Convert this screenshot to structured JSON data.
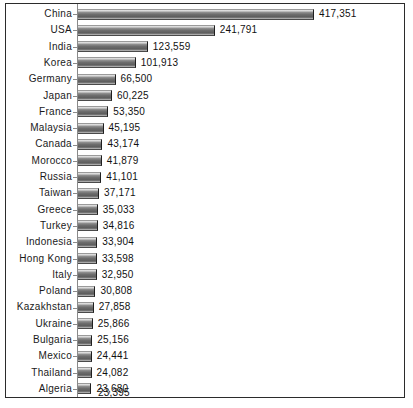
{
  "chart_data": {
    "type": "bar",
    "orientation": "horizontal",
    "title": "",
    "subtitle": "",
    "xlabel": "",
    "ylabel": "",
    "grid": false,
    "legend": null,
    "axis_line": true,
    "value_labels": true,
    "xlim": [
      0,
      417351
    ],
    "categories": [
      "China",
      "USA",
      "India",
      "Korea",
      "Germany",
      "Japan",
      "France",
      "Malaysia",
      "Canada",
      "Morocco",
      "Russia",
      "Taiwan",
      "Greece",
      "Turkey",
      "Indonesia",
      "Hong Kong",
      "Italy",
      "Poland",
      "Kazakhstan",
      "Ukraine",
      "Bulgaria",
      "Mexico",
      "Thailand",
      "Algeria",
      "Spain"
    ],
    "values": [
      417351,
      241791,
      123559,
      101913,
      66500,
      60225,
      53350,
      45195,
      43174,
      41879,
      41101,
      37171,
      35033,
      34816,
      33904,
      33598,
      32950,
      30808,
      27858,
      25866,
      25156,
      24441,
      24082,
      23680,
      23395
    ],
    "value_labels_text": [
      "417,351",
      "241,791",
      "123,559",
      "101,913",
      "66,500",
      "60,225",
      "53,350",
      "45,195",
      "43,174",
      "41,879",
      "41,101",
      "37,171",
      "35,033",
      "34,816",
      "33,904",
      "33,598",
      "32,950",
      "30,808",
      "27,858",
      "25,866",
      "25,156",
      "24,441",
      "24,082",
      "23,680",
      "23,395"
    ],
    "colors": {
      "bar_light": "#e8e8e8",
      "bar_mid": "#6e6e6e",
      "bar_dark": "#1f1f1f",
      "frame": "#2b2b2b",
      "axis": "#8a8a8a",
      "text": "#111111",
      "background": "#ffffff"
    }
  }
}
